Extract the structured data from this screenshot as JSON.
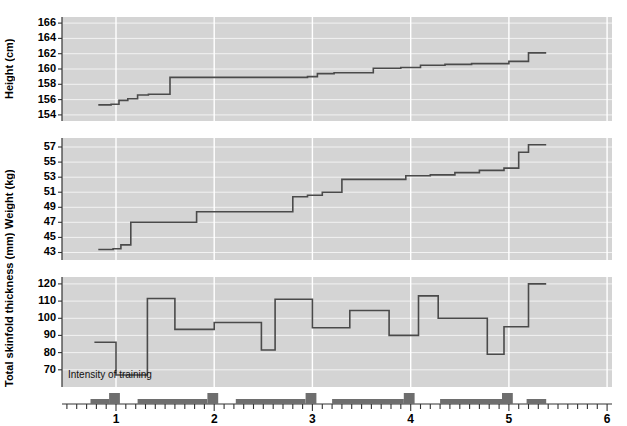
{
  "figure": {
    "annotation": "Intensity of training",
    "line_color": "#4a4a4a",
    "panel_bg": "#d4d4d4",
    "bar_color": "#6e6e6e"
  },
  "xaxis": {
    "label": "",
    "ticks": [
      "1",
      "2",
      "3",
      "4",
      "5",
      "6"
    ],
    "range": [
      0.45,
      6.05
    ],
    "minor_step": 0.1
  },
  "chart_data": [
    {
      "type": "line",
      "title": "",
      "ylabel": "Height (cm)",
      "xlabel": "",
      "ylim": [
        153.2,
        166.8
      ],
      "yticks": [
        154,
        156,
        158,
        160,
        162,
        164,
        166
      ],
      "grid": true,
      "step": "post",
      "x": [
        0.82,
        0.95,
        1.03,
        1.12,
        1.22,
        1.33,
        1.55,
        1.7,
        1.82,
        1.92,
        2.05,
        2.3,
        2.6,
        2.95,
        3.05,
        3.22,
        3.45,
        3.62,
        3.9,
        4.1,
        4.35,
        4.62,
        5.0,
        5.2
      ],
      "y": [
        155.3,
        155.4,
        155.9,
        156.1,
        156.6,
        156.7,
        158.9,
        158.9,
        158.9,
        158.9,
        158.9,
        158.9,
        158.9,
        159.0,
        159.4,
        159.5,
        159.5,
        160.1,
        160.2,
        160.5,
        160.6,
        160.7,
        161.0,
        162.1
      ]
    },
    {
      "type": "line",
      "title": "",
      "ylabel": "Weight (kg)",
      "xlabel": "",
      "ylim": [
        42.0,
        58.2
      ],
      "yticks": [
        43,
        45,
        47,
        49,
        51,
        53,
        55,
        57
      ],
      "grid": true,
      "step": "post",
      "x": [
        0.82,
        0.97,
        1.05,
        1.15,
        1.5,
        1.82,
        2.1,
        2.62,
        2.8,
        2.95,
        3.1,
        3.3,
        3.62,
        3.95,
        4.2,
        4.45,
        4.7,
        4.95,
        5.1,
        5.2
      ],
      "y": [
        43.4,
        43.5,
        44.0,
        47.0,
        47.0,
        48.4,
        48.4,
        48.4,
        50.4,
        50.6,
        51.0,
        52.7,
        52.7,
        53.2,
        53.3,
        53.6,
        53.9,
        54.2,
        56.3,
        57.3
      ]
    },
    {
      "type": "line",
      "title": "",
      "ylabel": "Total skinfold thickness (mm)",
      "xlabel": "",
      "ylim": [
        60,
        124
      ],
      "yticks": [
        70,
        80,
        90,
        100,
        110,
        120
      ],
      "grid": true,
      "step": "post",
      "x": [
        0.78,
        0.92,
        1.0,
        1.32,
        1.45,
        1.6,
        2.0,
        2.12,
        2.22,
        2.48,
        2.62,
        2.85,
        3.0,
        3.12,
        3.38,
        3.6,
        3.78,
        3.92,
        4.08,
        4.28,
        4.52,
        4.78,
        4.95,
        5.08,
        5.2
      ],
      "y": [
        86,
        86,
        67,
        111.5,
        111.5,
        93.5,
        97.5,
        97.5,
        97.5,
        81.5,
        111,
        111,
        94.5,
        94.5,
        104.5,
        104.5,
        90,
        90,
        113,
        100,
        100,
        79,
        95,
        95,
        120
      ]
    }
  ],
  "intensity_bars": [
    {
      "x0": 0.74,
      "x1": 0.93,
      "level": 1
    },
    {
      "x0": 0.93,
      "x1": 1.04,
      "level": 2
    },
    {
      "x0": 1.22,
      "x1": 1.93,
      "level": 1
    },
    {
      "x0": 1.93,
      "x1": 2.04,
      "level": 2
    },
    {
      "x0": 2.22,
      "x1": 2.93,
      "level": 1
    },
    {
      "x0": 2.93,
      "x1": 3.04,
      "level": 2
    },
    {
      "x0": 3.2,
      "x1": 3.93,
      "level": 1
    },
    {
      "x0": 3.93,
      "x1": 4.04,
      "level": 2
    },
    {
      "x0": 4.3,
      "x1": 4.93,
      "level": 1
    },
    {
      "x0": 4.93,
      "x1": 5.04,
      "level": 2
    },
    {
      "x0": 5.18,
      "x1": 5.38,
      "level": 1
    }
  ]
}
